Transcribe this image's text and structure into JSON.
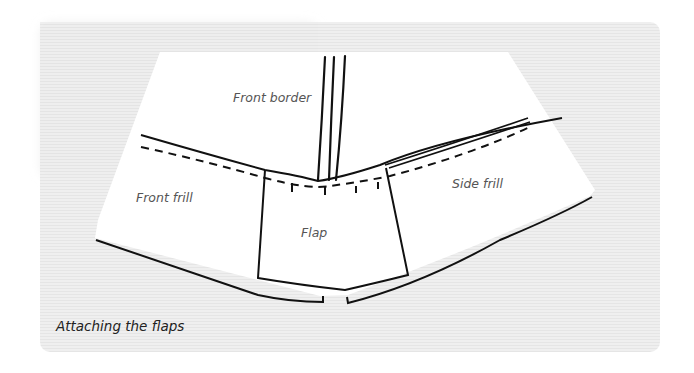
{
  "diagram": {
    "type": "sewing-instruction-illustration",
    "caption": "Attaching the flaps",
    "labels": {
      "front_border": "Front border",
      "front_frill": "Front frill",
      "side_frill": "Side frill",
      "flap": "Flap"
    },
    "colors": {
      "background_texture": "#efefef",
      "fabric": "#ffffff",
      "line": "#111111",
      "label_text": "#555555",
      "caption_text": "#222222"
    }
  }
}
